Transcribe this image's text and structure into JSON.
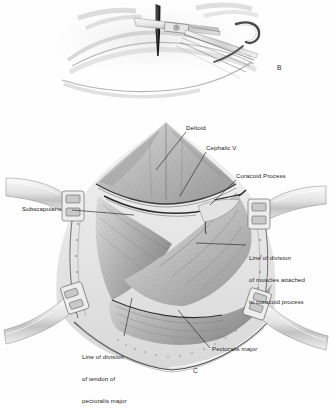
{
  "figure": {
    "type": "medical-surgical-illustration",
    "style": "grayscale pencil / wash anatomical drawing",
    "background_color": "#ffffff",
    "ink_color": "#232323",
    "panels": [
      {
        "letter": "B",
        "caption_position": "bottom-right",
        "subject": "Osteotome and knife dividing the coracoid process with a retractor hook"
      },
      {
        "letter": "C",
        "caption_position": "bottom-center",
        "subject": "Deltopectoral exposure of the shoulder held open with four self-retaining retractors"
      }
    ]
  },
  "panel_b": {
    "letter": "B",
    "instruments": [
      "knife-blade",
      "osteotome",
      "retractor-hook"
    ]
  },
  "panel_c": {
    "letter": "C",
    "retractors": [
      "retractor-left",
      "retractor-right",
      "retractor-bottom-left",
      "retractor-bottom-right"
    ],
    "labels": [
      {
        "id": "deltoid",
        "text": "Deltoid",
        "lines": [
          "Deltoid"
        ],
        "x": 186,
        "y": 127
      },
      {
        "id": "cephalic-vein",
        "text": "Cephalic V.",
        "lines": [
          "Cephalic V."
        ],
        "x": 206,
        "y": 147
      },
      {
        "id": "coracoid-process",
        "text": "Coracoid Process",
        "lines": [
          "Coracoid Process"
        ],
        "x": 236,
        "y": 175
      },
      {
        "id": "subscapularis",
        "text": "Subscapularis",
        "lines": [
          "Subscapularis"
        ],
        "x": 24,
        "y": 208
      },
      {
        "id": "line-of-division-coracoid",
        "text": "Line of division of muscles attached to coracoid process",
        "lines": [
          "Line of division",
          "of muscles attached",
          "to coracoid process"
        ],
        "x": 249,
        "y": 243
      },
      {
        "id": "line-of-division-pectoralis",
        "text": "Line of division of tendon of pectoralis major",
        "lines": [
          "Line of division",
          "of tendon of",
          "pectoralis major"
        ],
        "x": 82,
        "y": 341
      },
      {
        "id": "pectoralis-major",
        "text": "Pectoralis major",
        "lines": [
          "Pectoralis major"
        ],
        "x": 213,
        "y": 348
      }
    ]
  }
}
